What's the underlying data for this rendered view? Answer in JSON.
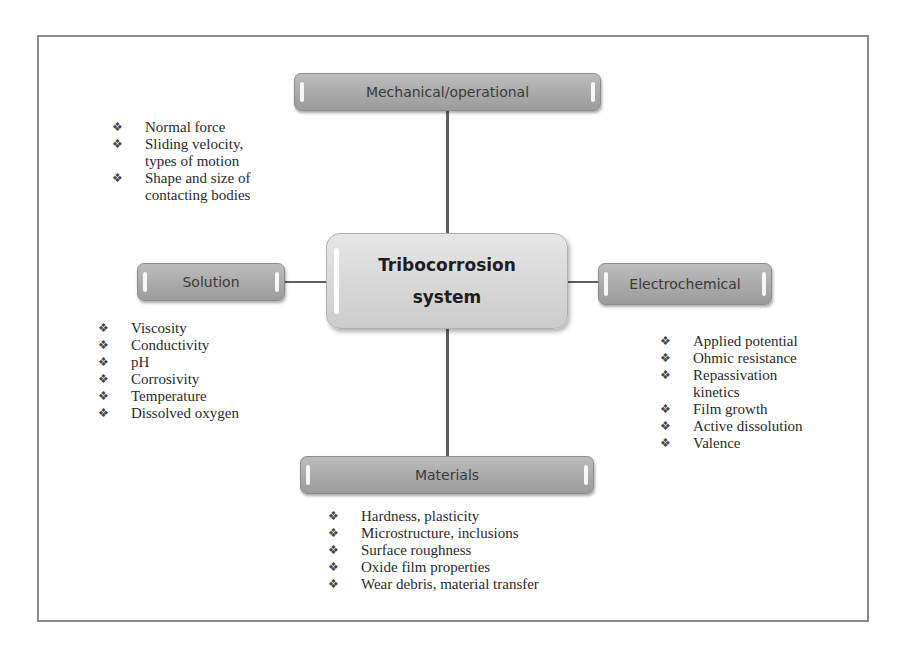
{
  "diagram": {
    "center": {
      "line1": "Tribocorrosion",
      "line2": "system"
    },
    "nodes": {
      "mechanical": {
        "label": "Mechanical/operational",
        "items": [
          "Normal force",
          "Sliding velocity, types of motion",
          "Shape and size of contacting bodies"
        ]
      },
      "solution": {
        "label": "Solution",
        "items": [
          "Viscosity",
          "Conductivity",
          "pH",
          "Corrosivity",
          "Temperature",
          "Dissolved oxygen"
        ]
      },
      "electrochemical": {
        "label": "Electrochemical",
        "items": [
          "Applied potential",
          "Ohmic resistance",
          "Repassivation kinetics",
          "Film growth",
          "Active dissolution",
          "Valence"
        ]
      },
      "materials": {
        "label": "Materials",
        "items": [
          "Hardness, plasticity",
          "Microstructure, inclusions",
          "Surface roughness",
          "Oxide film properties",
          "Wear debris, material transfer"
        ]
      }
    },
    "bullet_glyph": "❖",
    "colors": {
      "node_fill": "#a9a9a9",
      "center_fill": "#d6d6d6",
      "line": "#5f5f5f",
      "frame": "#8a8a8a"
    }
  }
}
